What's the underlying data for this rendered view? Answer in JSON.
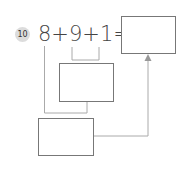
{
  "problem": {
    "number": "10",
    "expression": "8+9+1=",
    "terms": [
      "8",
      "9",
      "1"
    ],
    "operators": [
      "+",
      "+",
      "="
    ]
  },
  "boxes": {
    "answer": "",
    "middle": "",
    "bottom": ""
  },
  "colors": {
    "badge_bg": "#dcdcdc",
    "text": "#444444",
    "box_border": "#777777",
    "connector": "#aaaaaa"
  }
}
